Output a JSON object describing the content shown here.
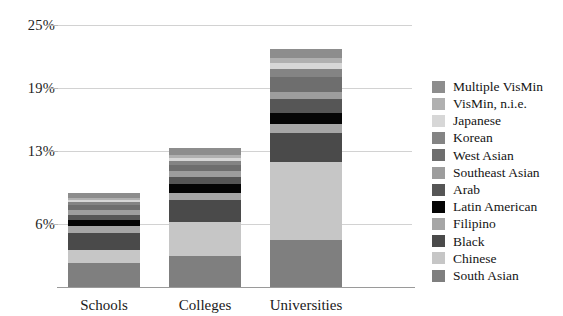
{
  "chart_data": {
    "type": "bar",
    "subtype": "stacked-bar",
    "title": "",
    "xlabel": "",
    "ylabel": "",
    "categories": [
      "Schools",
      "Colleges",
      "Universities"
    ],
    "ytick_labels": [
      "25%",
      "19%",
      "13%",
      "6%"
    ],
    "ytick_values": [
      25,
      19,
      13,
      6
    ],
    "ylim": [
      0,
      27
    ],
    "grid": true,
    "legend_position": "right",
    "stack_order_bottom_to_top": [
      "South Asian",
      "Chinese",
      "Black",
      "Filipino",
      "Latin American",
      "Arab",
      "Southeast Asian",
      "West Asian",
      "Korean",
      "Japanese",
      "VisMin, n.i.e.",
      "Multiple VisMin"
    ],
    "series": [
      {
        "name": "South Asian",
        "color": "#7f7f7f",
        "values": [
          2.3,
          3.0,
          4.5
        ]
      },
      {
        "name": "Chinese",
        "color": "#c6c6c6",
        "values": [
          1.2,
          3.2,
          7.4
        ]
      },
      {
        "name": "Black",
        "color": "#4a4a4a",
        "values": [
          1.7,
          2.1,
          2.8
        ]
      },
      {
        "name": "Filipino",
        "color": "#a6a6a6",
        "values": [
          0.6,
          0.7,
          0.9
        ]
      },
      {
        "name": "Latin American",
        "color": "#050505",
        "values": [
          0.6,
          0.8,
          1.0
        ]
      },
      {
        "name": "Arab",
        "color": "#565656",
        "values": [
          0.5,
          0.7,
          1.3
        ]
      },
      {
        "name": "Southeast Asian",
        "color": "#9d9d9d",
        "values": [
          0.5,
          0.6,
          0.7
        ]
      },
      {
        "name": "West Asian",
        "color": "#6e6e6e",
        "values": [
          0.4,
          0.5,
          1.4
        ]
      },
      {
        "name": "Korean",
        "color": "#848484",
        "values": [
          0.3,
          0.4,
          0.8
        ]
      },
      {
        "name": "Japanese",
        "color": "#d7d7d7",
        "values": [
          0.2,
          0.3,
          0.6
        ]
      },
      {
        "name": "VisMin, n.i.e.",
        "color": "#b0b0b0",
        "values": [
          0.2,
          0.3,
          0.5
        ]
      },
      {
        "name": "Multiple VisMin",
        "color": "#8d8d8d",
        "values": [
          0.5,
          0.7,
          0.8
        ]
      }
    ],
    "totals": [
      9.0,
      13.3,
      22.7
    ]
  },
  "yaxis": {
    "ticks": [
      {
        "label": "25%",
        "value": 25
      },
      {
        "label": "19%",
        "value": 19
      },
      {
        "label": "13%",
        "value": 13
      },
      {
        "label": "6%",
        "value": 6
      }
    ]
  },
  "xaxis": {
    "labels": [
      "Schools",
      "Colleges",
      "Universities"
    ]
  },
  "legend": {
    "items": [
      {
        "label": "Multiple VisMin",
        "color": "#8d8d8d"
      },
      {
        "label": "VisMin, n.i.e.",
        "color": "#b0b0b0"
      },
      {
        "label": "Japanese",
        "color": "#d7d7d7"
      },
      {
        "label": "Korean",
        "color": "#848484"
      },
      {
        "label": "West Asian",
        "color": "#6e6e6e"
      },
      {
        "label": "Southeast Asian",
        "color": "#9d9d9d"
      },
      {
        "label": "Arab",
        "color": "#565656"
      },
      {
        "label": "Latin American",
        "color": "#050505"
      },
      {
        "label": "Filipino",
        "color": "#a6a6a6"
      },
      {
        "label": "Black",
        "color": "#4a4a4a"
      },
      {
        "label": "Chinese",
        "color": "#c6c6c6"
      },
      {
        "label": "South Asian",
        "color": "#7f7f7f"
      }
    ]
  },
  "colors": {
    "gridline": "#d2d2d2",
    "axis": "#9a9a9a",
    "background": "#ffffff",
    "text": "#1a1a1a"
  }
}
